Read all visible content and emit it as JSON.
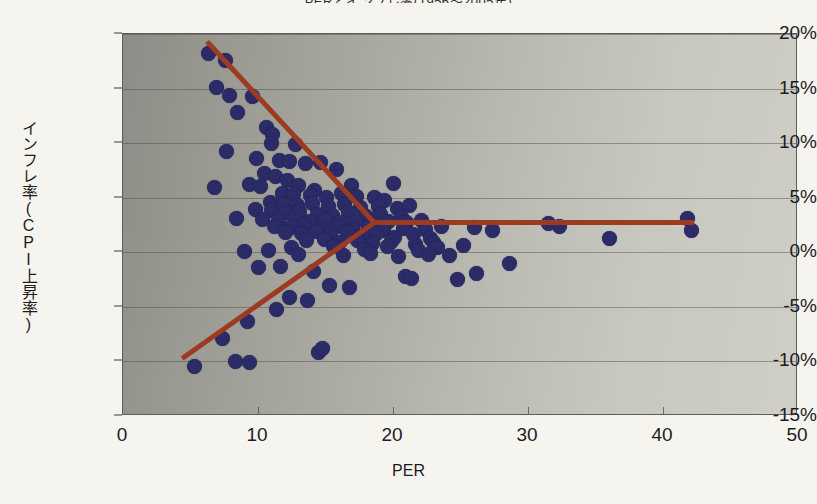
{
  "chart_data": {
    "type": "scatter",
    "title": "PERとインフレ率(1956～2005年)",
    "xlabel": "PER",
    "ylabel": "インフレ率(CPI上昇率)",
    "xlim": [
      0,
      50
    ],
    "ylim": [
      -15,
      20
    ],
    "xticks": [
      "0",
      "10",
      "20",
      "30",
      "40",
      "50"
    ],
    "xtick_values": [
      0,
      10,
      20,
      30,
      40,
      50
    ],
    "yticks": [
      "20%",
      "15%",
      "10%",
      "5%",
      "0%",
      "-5%",
      "-10%",
      "-15%"
    ],
    "ytick_values": [
      20,
      15,
      10,
      5,
      0,
      -5,
      -10,
      -15
    ],
    "grid": true,
    "legend": "none",
    "point_color": "#2b2b68",
    "trend_color": "#9d3b22",
    "plot_bg_from": "#8d8d87",
    "plot_bg_to": "#cfcfc7",
    "points": [
      [
        6.3,
        18.2
      ],
      [
        7.6,
        17.6
      ],
      [
        6.9,
        15.1
      ],
      [
        7.9,
        14.4
      ],
      [
        9.6,
        14.3
      ],
      [
        8.5,
        12.8
      ],
      [
        10.6,
        11.4
      ],
      [
        11.1,
        10.8
      ],
      [
        11.0,
        10.0
      ],
      [
        12.8,
        9.9
      ],
      [
        7.7,
        9.2
      ],
      [
        9.9,
        8.6
      ],
      [
        11.6,
        8.4
      ],
      [
        12.3,
        8.3
      ],
      [
        13.5,
        8.1
      ],
      [
        14.6,
        8.2
      ],
      [
        15.8,
        7.6
      ],
      [
        10.5,
        7.2
      ],
      [
        11.3,
        6.9
      ],
      [
        12.2,
        6.6
      ],
      [
        6.8,
        5.9
      ],
      [
        9.4,
        6.2
      ],
      [
        10.2,
        6.0
      ],
      [
        13.0,
        6.1
      ],
      [
        14.2,
        5.7
      ],
      [
        16.9,
        6.1
      ],
      [
        20.0,
        6.3
      ],
      [
        11.8,
        5.4
      ],
      [
        12.6,
        5.3
      ],
      [
        13.9,
        5.2
      ],
      [
        15.1,
        5.0
      ],
      [
        16.2,
        5.4
      ],
      [
        17.3,
        5.1
      ],
      [
        18.6,
        5.0
      ],
      [
        19.4,
        4.7
      ],
      [
        10.9,
        4.6
      ],
      [
        11.9,
        4.4
      ],
      [
        12.9,
        4.3
      ],
      [
        14.0,
        4.5
      ],
      [
        15.2,
        4.2
      ],
      [
        16.4,
        4.4
      ],
      [
        17.6,
        4.1
      ],
      [
        18.9,
        4.2
      ],
      [
        20.3,
        4.0
      ],
      [
        21.2,
        4.3
      ],
      [
        9.8,
        3.9
      ],
      [
        11.0,
        3.8
      ],
      [
        12.1,
        3.6
      ],
      [
        13.1,
        3.7
      ],
      [
        14.4,
        3.5
      ],
      [
        15.5,
        3.4
      ],
      [
        16.7,
        3.6
      ],
      [
        18.0,
        3.3
      ],
      [
        19.1,
        3.5
      ],
      [
        20.6,
        3.2
      ],
      [
        8.4,
        3.1
      ],
      [
        10.3,
        3.0
      ],
      [
        11.5,
        2.9
      ],
      [
        12.7,
        3.1
      ],
      [
        13.8,
        2.8
      ],
      [
        15.0,
        2.9
      ],
      [
        16.1,
        2.7
      ],
      [
        17.2,
        2.8
      ],
      [
        18.4,
        2.6
      ],
      [
        19.7,
        2.8
      ],
      [
        21.0,
        2.7
      ],
      [
        22.1,
        2.9
      ],
      [
        11.2,
        2.4
      ],
      [
        12.4,
        2.3
      ],
      [
        13.4,
        2.5
      ],
      [
        14.7,
        2.2
      ],
      [
        15.9,
        2.4
      ],
      [
        17.0,
        2.1
      ],
      [
        18.2,
        2.3
      ],
      [
        19.3,
        2.0
      ],
      [
        20.8,
        2.2
      ],
      [
        22.4,
        2.1
      ],
      [
        23.6,
        2.4
      ],
      [
        12.0,
        1.8
      ],
      [
        13.2,
        1.7
      ],
      [
        14.3,
        1.9
      ],
      [
        15.4,
        1.6
      ],
      [
        16.6,
        1.8
      ],
      [
        17.8,
        1.5
      ],
      [
        18.8,
        1.7
      ],
      [
        20.1,
        1.4
      ],
      [
        21.5,
        1.6
      ],
      [
        22.8,
        1.3
      ],
      [
        13.6,
        1.1
      ],
      [
        14.9,
        1.2
      ],
      [
        16.0,
        0.9
      ],
      [
        17.4,
        1.1
      ],
      [
        18.5,
        0.8
      ],
      [
        19.9,
        1.0
      ],
      [
        21.7,
        0.7
      ],
      [
        23.0,
        0.9
      ],
      [
        12.5,
        0.4
      ],
      [
        15.6,
        0.5
      ],
      [
        17.9,
        0.3
      ],
      [
        19.6,
        0.5
      ],
      [
        21.9,
        0.2
      ],
      [
        23.3,
        0.4
      ],
      [
        9.0,
        0.1
      ],
      [
        10.8,
        0.2
      ],
      [
        13.0,
        -0.2
      ],
      [
        16.3,
        -0.3
      ],
      [
        18.3,
        -0.1
      ],
      [
        20.4,
        -0.4
      ],
      [
        22.6,
        -0.2
      ],
      [
        24.2,
        -0.3
      ],
      [
        25.2,
        0.6
      ],
      [
        26.0,
        2.3
      ],
      [
        27.4,
        2.0
      ],
      [
        28.6,
        -1.0
      ],
      [
        31.5,
        2.6
      ],
      [
        32.3,
        2.4
      ],
      [
        36.0,
        1.3
      ],
      [
        41.8,
        3.1
      ],
      [
        42.1,
        2.0
      ],
      [
        10.0,
        -1.4
      ],
      [
        11.7,
        -1.3
      ],
      [
        14.1,
        -1.8
      ],
      [
        20.9,
        -2.2
      ],
      [
        21.4,
        -2.4
      ],
      [
        16.8,
        -3.2
      ],
      [
        15.3,
        -3.0
      ],
      [
        12.3,
        -4.1
      ],
      [
        13.7,
        -4.4
      ],
      [
        11.4,
        -5.2
      ],
      [
        9.2,
        -6.3
      ],
      [
        7.4,
        -7.9
      ],
      [
        8.3,
        -10.0
      ],
      [
        14.5,
        -9.2
      ],
      [
        14.8,
        -8.8
      ],
      [
        5.3,
        -10.5
      ],
      [
        9.4,
        -10.1
      ],
      [
        24.8,
        -2.5
      ],
      [
        26.2,
        -1.9
      ]
    ],
    "trendlines": [
      {
        "name": "descending-line",
        "x1": 6.2,
        "y1": 19.3,
        "x2": 18.6,
        "y2": 2.7
      },
      {
        "name": "ascending-line",
        "x1": 4.4,
        "y1": -9.7,
        "x2": 18.6,
        "y2": 2.7
      },
      {
        "name": "flat-line",
        "x1": 18.6,
        "y1": 2.7,
        "x2": 42.3,
        "y2": 2.7
      }
    ]
  }
}
